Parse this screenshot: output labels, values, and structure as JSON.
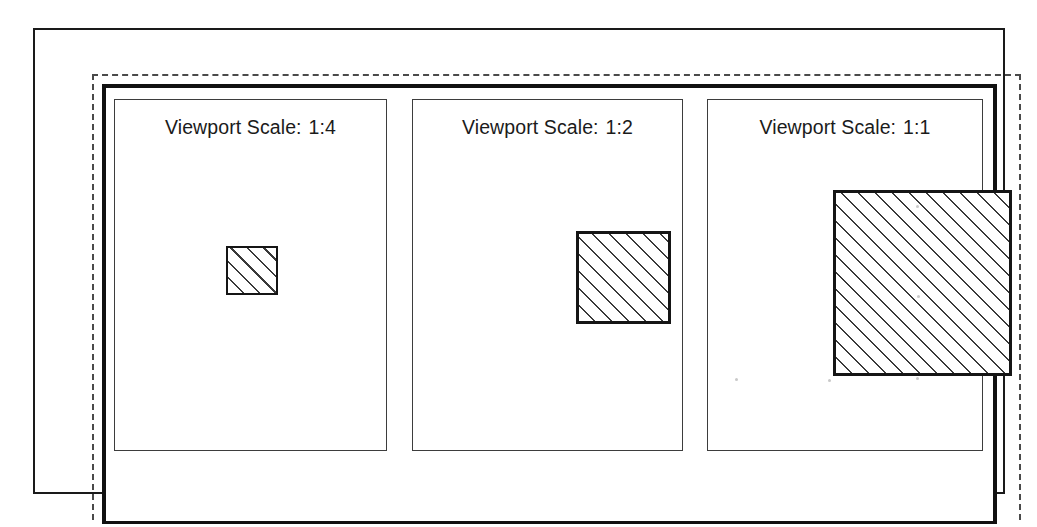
{
  "document": {
    "title": "Viewport Scale Comparison",
    "sheet_border_color": "#1a1a1a",
    "dashed_guide_color": "#4a4a4a",
    "paper_frame_color": "#111111",
    "hatch_line_color": "#3a3a3a",
    "background_color": "#ffffff"
  },
  "panels": [
    {
      "id": "viewport-1",
      "label_prefix": "Viewport Scale:",
      "scale": "1:4",
      "label_full": "Viewport Scale:  1:4",
      "shape": {
        "type": "hatched-rectangle",
        "hatch_angle_deg": 45,
        "relative_size": 0.25,
        "width_px": 52,
        "height_px": 49
      }
    },
    {
      "id": "viewport-2",
      "label_prefix": "Viewport Scale:",
      "scale": "1:2",
      "label_full": "Viewport Scale:  1:2",
      "shape": {
        "type": "hatched-rectangle",
        "hatch_angle_deg": 45,
        "relative_size": 0.5,
        "width_px": 95,
        "height_px": 93
      }
    },
    {
      "id": "viewport-3",
      "label_prefix": "Viewport Scale:",
      "scale": "1:1",
      "label_full": "Viewport Scale:  1:1",
      "shape": {
        "type": "hatched-rectangle",
        "hatch_angle_deg": 45,
        "relative_size": 1.0,
        "width_px": 179,
        "height_px": 186
      }
    }
  ],
  "artifacts": {
    "speckles": [
      {
        "x": 735,
        "y": 378
      },
      {
        "x": 828,
        "y": 379
      },
      {
        "x": 916,
        "y": 377
      },
      {
        "x": 916,
        "y": 205
      },
      {
        "x": 917,
        "y": 295
      }
    ]
  }
}
